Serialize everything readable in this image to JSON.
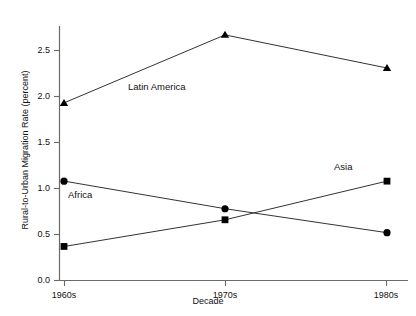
{
  "chart_data": {
    "type": "line",
    "title": "",
    "subtitle": "",
    "xlabel": "Decade",
    "ylabel": "Rural-to-Urban Migration Rate (percent)",
    "categories": [
      "1960s",
      "1970s",
      "1980s"
    ],
    "x_tick_labels": [
      "1960s",
      "1970s",
      "1980s"
    ],
    "y_tick_labels": [
      "0.0",
      "0.5",
      "1.0",
      "1.5",
      "2.0",
      "2.5"
    ],
    "y_tick_values": [
      0.0,
      0.5,
      1.0,
      1.5,
      2.0,
      2.5
    ],
    "ylim": [
      0.0,
      2.75
    ],
    "grid": false,
    "legend_position": "inline-annotations",
    "series": [
      {
        "name": "Latin America",
        "marker": "triangle",
        "color": "#000000",
        "values": [
          1.93,
          2.67,
          2.31
        ]
      },
      {
        "name": "Africa",
        "marker": "circle",
        "color": "#000000",
        "values": [
          1.08,
          0.78,
          0.52
        ]
      },
      {
        "name": "Asia",
        "marker": "square",
        "color": "#000000",
        "values": [
          0.37,
          0.66,
          1.08
        ]
      }
    ],
    "annotations": [
      {
        "text": "Latin America",
        "series": "Latin America",
        "x_px": 128,
        "y_px": 82
      },
      {
        "text": "Africa",
        "series": "Africa",
        "x_px": 68,
        "y_px": 190
      },
      {
        "text": "Asia",
        "series": "Asia",
        "x_px": 334,
        "y_px": 163
      }
    ],
    "axis_color": "#555555",
    "line_color": "#333333",
    "background": "#ffffff"
  },
  "axes": {
    "x_title": "Decade",
    "y_title": "Rural-to-Urban Migration Rate (percent)",
    "y_ticks": [
      "2.5",
      "2.0",
      "1.5",
      "1.0",
      "0.5",
      "0.0"
    ],
    "x_ticks": [
      "1960s",
      "1970s",
      "1980s"
    ]
  },
  "labels": {
    "latin_america": "Latin America",
    "africa": "Africa",
    "asia": "Asia"
  }
}
